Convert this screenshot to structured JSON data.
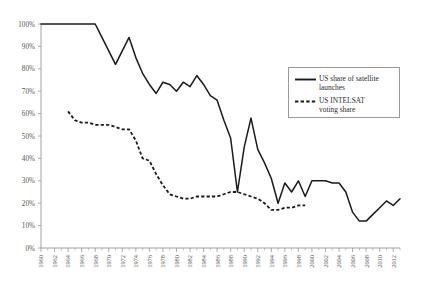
{
  "chart_data": {
    "type": "line",
    "title": "",
    "subtitle": "",
    "xlabel": "",
    "ylabel": "",
    "xlim": [
      1960,
      2013
    ],
    "ylim": [
      0,
      100
    ],
    "grid": false,
    "legend_position": "upper-right-inside",
    "y_ticks": [
      "0%",
      "10%",
      "20%",
      "30%",
      "40%",
      "50%",
      "60%",
      "70%",
      "80%",
      "90%",
      "100%"
    ],
    "y_tick_values": [
      0,
      10,
      20,
      30,
      40,
      50,
      60,
      70,
      80,
      90,
      100
    ],
    "x_ticks": [
      "1960",
      "1962",
      "1964",
      "1966",
      "1968",
      "1970",
      "1972",
      "1974",
      "1976",
      "1978",
      "1980",
      "1982",
      "1984",
      "1986",
      "1988",
      "1990",
      "1992",
      "1994",
      "1996",
      "1998",
      "2000",
      "2002",
      "2004",
      "2006",
      "2008",
      "2010",
      "2012"
    ],
    "x_tick_values": [
      1960,
      1962,
      1964,
      1966,
      1968,
      1970,
      1972,
      1974,
      1976,
      1978,
      1980,
      1982,
      1984,
      1986,
      1988,
      1990,
      1992,
      1994,
      1996,
      1998,
      2000,
      2002,
      2004,
      2006,
      2008,
      2010,
      2012
    ],
    "series": [
      {
        "name": "US share of satellite launches",
        "style": "solid",
        "color": "#1a1a1a",
        "x": [
          1960,
          1961,
          1962,
          1963,
          1964,
          1965,
          1966,
          1967,
          1968,
          1969,
          1970,
          1971,
          1972,
          1973,
          1974,
          1975,
          1976,
          1977,
          1978,
          1979,
          1980,
          1981,
          1982,
          1983,
          1984,
          1985,
          1986,
          1987,
          1988,
          1989,
          1990,
          1991,
          1992,
          1993,
          1994,
          1995,
          1996,
          1997,
          1998,
          1999,
          2000,
          2001,
          2002,
          2003,
          2004,
          2005,
          2006,
          2007,
          2008,
          2009,
          2010,
          2011,
          2012,
          2013
        ],
        "y": [
          100,
          100,
          100,
          100,
          100,
          100,
          100,
          100,
          100,
          94,
          88,
          82,
          88,
          94,
          85,
          78,
          73,
          69,
          74,
          73,
          70,
          74,
          72,
          77,
          73,
          68,
          66,
          57,
          49,
          25,
          45,
          58,
          44,
          38,
          31,
          20,
          29,
          25,
          30,
          23,
          30,
          30,
          30,
          29,
          29,
          25,
          16,
          12,
          12,
          15,
          18,
          21,
          19,
          22
        ]
      },
      {
        "name": "US INTELSAT voting share",
        "style": "dashed",
        "color": "#1a1a1a",
        "x": [
          1964,
          1965,
          1966,
          1967,
          1968,
          1969,
          1970,
          1971,
          1972,
          1973,
          1974,
          1975,
          1976,
          1977,
          1978,
          1979,
          1980,
          1981,
          1982,
          1983,
          1984,
          1985,
          1986,
          1987,
          1988,
          1989,
          1990,
          1991,
          1992,
          1993,
          1994,
          1995,
          1996,
          1997,
          1998,
          1999
        ],
        "y": [
          61,
          57,
          56,
          56,
          55,
          55,
          55,
          54,
          53,
          53,
          48,
          40,
          39,
          33,
          28,
          24,
          23,
          22,
          22,
          23,
          23,
          23,
          23,
          24,
          25,
          25,
          24,
          23,
          22,
          20,
          17,
          17,
          18,
          18,
          19,
          19
        ]
      }
    ]
  },
  "legend": {
    "entries": [
      {
        "label": "US share of satellite\nlaunches",
        "style": "solid"
      },
      {
        "label": "US INTELSAT\nvoting share",
        "style": "dashed"
      }
    ]
  }
}
